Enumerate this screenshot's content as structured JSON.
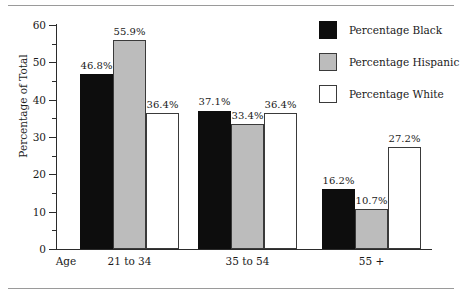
{
  "chart_data": {
    "type": "bar",
    "title": "",
    "subtitle": "",
    "xlabel": "Age",
    "ylabel": "Percentage of Total",
    "categories": [
      "21 to 34",
      "35 to 54",
      "55 +"
    ],
    "series": [
      {
        "name": "Percentage Black",
        "color": "#0d0d0d",
        "values": [
          46.8,
          37.1,
          16.2
        ],
        "labels": [
          "46.8%",
          "37.1%",
          "16.2%"
        ]
      },
      {
        "name": "Percentage Hispanic",
        "color": "#bcbcbc",
        "values": [
          55.9,
          33.4,
          10.7
        ],
        "labels": [
          "55.9%",
          "33.4%",
          "10.7%"
        ]
      },
      {
        "name": "Percentage White",
        "color": "#ffffff",
        "values": [
          36.4,
          36.4,
          27.2
        ],
        "labels": [
          "36.4%",
          "36.4%",
          "27.2%"
        ]
      }
    ],
    "ylim": [
      0,
      60
    ],
    "ytick_labels": [
      "0",
      "10",
      "20",
      "30",
      "40",
      "50",
      "60"
    ],
    "ytick_values": [
      0,
      10,
      20,
      30,
      40,
      50,
      60
    ],
    "yminor_values": [
      5,
      15,
      25,
      35,
      45,
      55
    ],
    "grid": false,
    "legend_position": "top-right",
    "axis_origin_label": "Age"
  },
  "legend": {
    "items": [
      {
        "label": "Percentage Black",
        "swatch": "black"
      },
      {
        "label": "Percentage Hispanic",
        "swatch": "gray"
      },
      {
        "label": "Percentage White",
        "swatch": "white"
      }
    ]
  },
  "axis": {
    "y_title": "Percentage of Total",
    "x_origin_label": "Age",
    "x_categories": [
      "21 to 34",
      "35 to 54",
      "55 +"
    ],
    "y_ticks": [
      "0",
      "10",
      "20",
      "30",
      "40",
      "50",
      "60"
    ]
  }
}
